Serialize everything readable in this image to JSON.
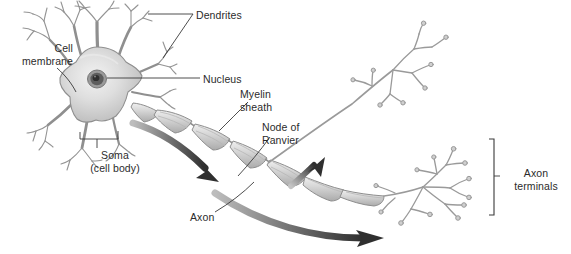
{
  "figure": {
    "background_color": "#ffffff",
    "ink_color": "#2b2b2b",
    "cell_fill_color": "#d9d9d9",
    "cell_stroke_color": "#8a8a8a",
    "myelin_fill_color": "#cfcfcf",
    "arrow_color": "#3a3a3a",
    "leader_line_color": "#3a3a3a"
  },
  "labels": [
    {
      "id": "dendrites",
      "name": "Dendrites",
      "text": "Dendrites",
      "lines": [
        "Dendrites"
      ],
      "align": "left",
      "x": 196,
      "y": 9
    },
    {
      "id": "cell-membrane",
      "name": "Cell membrane",
      "text": "Cell\nmembrane",
      "lines": [
        "Cell",
        "membrane"
      ],
      "align": "right",
      "x": 2,
      "y": 42
    },
    {
      "id": "nucleus",
      "name": "Nucleus",
      "text": "Nucleus",
      "lines": [
        "Nucleus"
      ],
      "align": "left",
      "x": 203,
      "y": 73
    },
    {
      "id": "myelin-sheath",
      "name": "Myelin sheath",
      "text": "Myelin\nsheath",
      "lines": [
        "Myelin",
        "sheath"
      ],
      "align": "left",
      "x": 240,
      "y": 88
    },
    {
      "id": "node-of-ranvier",
      "name": "Node of Ranvier",
      "text": "Node of\nRanvier",
      "lines": [
        "Node of",
        "Ranvier"
      ],
      "align": "left",
      "x": 262,
      "y": 121
    },
    {
      "id": "soma",
      "name": "Soma (cell body)",
      "text": "Soma\n(cell body)",
      "lines": [
        "Soma",
        "(cell body)"
      ],
      "align": "center",
      "x": 110,
      "y": 149
    },
    {
      "id": "axon",
      "name": "Axon",
      "text": "Axon",
      "lines": [
        "Axon"
      ],
      "align": "left",
      "x": 190,
      "y": 211
    },
    {
      "id": "axon-terminals",
      "name": "Axon terminals",
      "text": "Axon\nterminals",
      "lines": [
        "Axon",
        "terminals"
      ],
      "align": "center",
      "x": 505,
      "y": 167
    }
  ],
  "structures": {
    "soma_description": "Star-shaped cell body with shaded gradient fill",
    "nucleus_description": "Dark oval nucleus with nucleolus inside the soma",
    "dendrite_count": "many branching dendrites radiating from the soma",
    "myelin_segments": "chain of overlapping myelin sheath segments along the axon",
    "node_count": "gaps between myelin segments are nodes of Ranvier",
    "terminal_clusters": "two branching axon terminal clusters at right",
    "signal_arrows": "three dark arrows indicating direction of impulse travel"
  },
  "bracket": {
    "name": "axon-terminals-bracket",
    "orientation": "vertical-right"
  }
}
